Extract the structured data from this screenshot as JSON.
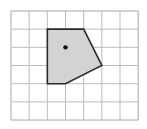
{
  "diagram": {
    "grid": {
      "columns": 7,
      "rows": 6,
      "origin_px": [
        11,
        11
      ],
      "cell_px": 18.17,
      "line_color": "#bdbdbd",
      "border_color": "#a8a8a8"
    },
    "polygon": {
      "vertices_grid": [
        [
          2,
          1
        ],
        [
          4,
          1
        ],
        [
          5,
          3
        ],
        [
          3,
          4
        ],
        [
          2,
          4
        ]
      ],
      "fill_color": "#d3d3d3",
      "stroke_color": "#2a2a2a"
    },
    "point": {
      "position_grid": [
        3,
        2
      ],
      "color": "#111111"
    }
  }
}
